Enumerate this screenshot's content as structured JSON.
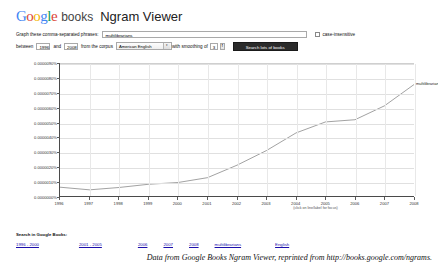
{
  "header": {
    "logo_google_letters": [
      "G",
      "o",
      "o",
      "g",
      "l",
      "e"
    ],
    "logo_books": "books",
    "title": "Ngram Viewer"
  },
  "query_form": {
    "phrases_label": "Graph these comma-separated phrases:",
    "phrases_value": "multilibrarians",
    "case_insensitive_label": "case-insensitive",
    "between_label": "between",
    "start_year": "1996",
    "and_label": "and",
    "end_year": "2008",
    "corpus_label": "from the corpus",
    "corpus_value": "American English",
    "smoothing_label": "with smoothing of",
    "smoothing_value": "3",
    "search_button_label": "Search lots of books",
    "select_arrow_glyph": "▾",
    "stepper_up_glyph": "▲",
    "stepper_down_glyph": "▼"
  },
  "chart_data": {
    "type": "line",
    "title": "",
    "xlabel": "",
    "ylabel": "",
    "x": [
      1996,
      1997,
      1998,
      1999,
      2000,
      2001,
      2002,
      2003,
      2004,
      2005,
      2006,
      2007,
      2008
    ],
    "xlim": [
      1996,
      2008
    ],
    "ylim": [
      0.0,
      9e-06
    ],
    "grid": true,
    "legend_position": "right-of-line-end",
    "x_tick_labels": [
      "1996",
      "1997",
      "1998",
      "1999",
      "2000",
      "2001",
      "2002",
      "2003",
      "2004",
      "2005",
      "2006",
      "2007",
      "2008"
    ],
    "y_tick_values": [
      9e-06,
      8e-06,
      7e-06,
      6e-06,
      5e-06,
      4e-06,
      3e-06,
      2e-06,
      1e-06,
      0.0
    ],
    "y_tick_labels": [
      "0.0000090%",
      "0.0000080%",
      "0.0000070%",
      "0.0000060%",
      "0.0000050%",
      "0.0000040%",
      "0.0000030%",
      "0.0000020%",
      "0.0000010%",
      "0.0000000%"
    ],
    "series": [
      {
        "name": "multilibrarians",
        "color": "#555555",
        "values": [
          6e-07,
          4.2e-07,
          5.8e-07,
          8e-07,
          9.2e-07,
          1.25e-06,
          2.1e-06,
          3.1e-06,
          4.3e-06,
          5.05e-06,
          5.2e-06,
          6.15e-06,
          7.6e-06
        ]
      }
    ],
    "annotations": [
      "(click on line/label for focus)"
    ]
  },
  "chart_notes": {
    "focus_note": "(click on line/label for focus)",
    "series_label": "multilibrarians"
  },
  "footer": {
    "heading": "Search in Google Books:",
    "links": [
      "1996 - 2000",
      "2001 - 2005",
      "2006",
      "2007",
      "2008",
      "multilibrarians",
      "English"
    ]
  },
  "caption": {
    "text": "Data from Google Books Ngram Viewer, reprinted from http://books.google.com/ngrams."
  }
}
